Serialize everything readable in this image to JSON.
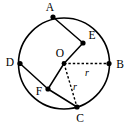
{
  "figure": {
    "background_color": "#ffffff",
    "stroke_color": "#000000",
    "width": 129,
    "height": 127
  },
  "circle": {
    "center_label": "O",
    "cx": 64,
    "cy": 63.5,
    "r": 45.5
  },
  "points": [
    {
      "id": "A",
      "label": "A",
      "x": 53,
      "y": 17,
      "label_x": 50,
      "label_y": 8,
      "on_circle": true
    },
    {
      "id": "E",
      "label": "E",
      "x": 83,
      "y": 43,
      "label_x": 92,
      "label_y": 36,
      "on_circle": true
    },
    {
      "id": "B",
      "label": "B",
      "x": 109,
      "y": 63.5,
      "label_x": 120,
      "label_y": 65,
      "on_circle": true
    },
    {
      "id": "C",
      "label": "C",
      "x": 77,
      "y": 107,
      "label_x": 80,
      "label_y": 119,
      "on_circle": true
    },
    {
      "id": "F",
      "label": "F",
      "x": 48,
      "y": 89,
      "label_x": 39,
      "label_y": 92,
      "on_circle": false
    },
    {
      "id": "D",
      "label": "D",
      "x": 20,
      "y": 63.5,
      "label_x": 10,
      "label_y": 63,
      "on_circle": true
    },
    {
      "id": "O",
      "label": "O",
      "x": 64,
      "y": 63.5,
      "label_x": 60,
      "label_y": 54,
      "on_circle": false
    }
  ],
  "segments": [
    {
      "id": "A-E",
      "from": "A",
      "to": "E",
      "style": "solid"
    },
    {
      "id": "E-O",
      "from": "E",
      "to": "O",
      "style": "solid"
    },
    {
      "id": "O-F",
      "from": "O",
      "to": "F",
      "style": "solid"
    },
    {
      "id": "F-C",
      "from": "F",
      "to": "C",
      "style": "solid"
    },
    {
      "id": "D-F",
      "from": "D",
      "to": "F",
      "style": "solid"
    },
    {
      "id": "O-B",
      "from": "O",
      "to": "B",
      "style": "dashed"
    },
    {
      "id": "O-C",
      "from": "O",
      "to": "C",
      "style": "dashed"
    }
  ],
  "radius_labels": [
    {
      "id": "r-ob",
      "text": "r",
      "x": 87,
      "y": 74,
      "for_segment": "O-B"
    },
    {
      "id": "r-oc",
      "text": "r",
      "x": 75,
      "y": 88,
      "for_segment": "O-C"
    }
  ]
}
